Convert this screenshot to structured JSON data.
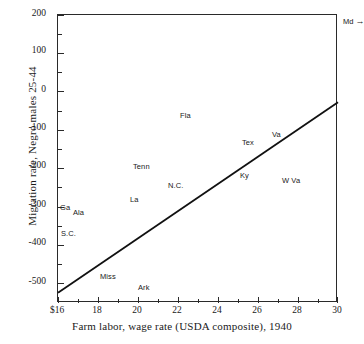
{
  "chart_data": {
    "type": "scatter",
    "title": "",
    "xlabel": "Farm labor, wage rate (USDA composite), 1940",
    "ylabel": "Migration rate, Negro males 25-44",
    "xlim": [
      16,
      30
    ],
    "ylim": [
      -550,
      200
    ],
    "grid": false,
    "legend": null,
    "x_tick_labels": [
      "$16",
      "18",
      "20",
      "22",
      "24",
      "26",
      "28",
      "30"
    ],
    "x_tick_values": [
      16,
      18,
      20,
      22,
      24,
      26,
      28,
      30
    ],
    "x_minor_step": 1,
    "y_tick_labels": [
      "200",
      "100",
      "0",
      "-100",
      "-200",
      "-300",
      "-400",
      "-500"
    ],
    "y_tick_values": [
      200,
      100,
      0,
      -100,
      -200,
      -300,
      -400,
      -500
    ],
    "y_minor_step": 50,
    "points": [
      {
        "label": "Ga",
        "x": 16.1,
        "y": -303
      },
      {
        "label": "Ala",
        "x": 16.75,
        "y": -315
      },
      {
        "label": "S.C.",
        "x": 16.15,
        "y": -370
      },
      {
        "label": "Miss",
        "x": 18.1,
        "y": -482
      },
      {
        "label": "Ark",
        "x": 20.0,
        "y": -512
      },
      {
        "label": "La",
        "x": 19.6,
        "y": -281
      },
      {
        "label": "Tenn",
        "x": 19.75,
        "y": -196
      },
      {
        "label": "N.C.",
        "x": 21.5,
        "y": -245
      },
      {
        "label": "Fla",
        "x": 22.1,
        "y": -64
      },
      {
        "label": "Ky",
        "x": 25.1,
        "y": -218
      },
      {
        "label": "Tex",
        "x": 25.2,
        "y": -134
      },
      {
        "label": "Va",
        "x": 26.7,
        "y": -113
      },
      {
        "label": "W Va",
        "x": 27.2,
        "y": -233
      }
    ],
    "trend_line": {
      "name": "fitted regression line",
      "x0": 16.0,
      "y0": -523,
      "x1": 30.0,
      "y1": -27
    },
    "annotations": [
      {
        "name": "md-offscale",
        "label": "Md",
        "arrow": "→",
        "position": "outside-top-right"
      }
    ]
  }
}
